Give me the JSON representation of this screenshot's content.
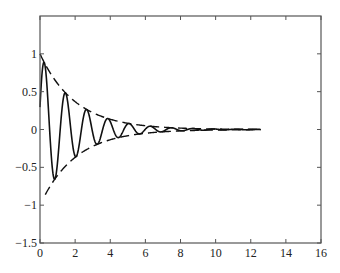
{
  "chart_data": {
    "type": "line",
    "title": "",
    "xlabel": "",
    "ylabel": "",
    "xlim": [
      0,
      16
    ],
    "ylim": [
      -1.5,
      1.5
    ],
    "grid": false,
    "legend": null,
    "x_ticks": [
      0,
      2,
      4,
      6,
      8,
      10,
      12,
      14,
      16
    ],
    "x_tick_labels": [
      "0",
      "2",
      "4",
      "6",
      "8",
      "10",
      "12",
      "14",
      "16"
    ],
    "y_ticks": [
      1,
      0.5,
      0,
      -0.5,
      -1,
      -1.5
    ],
    "y_tick_labels": [
      "1",
      "0.5",
      "0",
      "-0.5",
      "-1",
      "-1.5"
    ],
    "series": [
      {
        "name": "damped oscillation",
        "style": "solid",
        "description": "y = e^(-0.5t) * sin(5.2t + 0.3), t from 0 to 4*pi",
        "decay": 0.5,
        "omega": 5.2,
        "phase": 0.3,
        "t_start": 0,
        "t_end": 12.57,
        "sample_points": [
          {
            "x": 0,
            "y": 0.3
          },
          {
            "x": 0.25,
            "y": 0.87
          },
          {
            "x": 0.85,
            "y": -0.65
          },
          {
            "x": 1.45,
            "y": 0.44
          },
          {
            "x": 2.05,
            "y": -0.33
          },
          {
            "x": 2.65,
            "y": 0.25
          },
          {
            "x": 3.25,
            "y": -0.19
          },
          {
            "x": 3.85,
            "y": 0.14
          },
          {
            "x": 4.45,
            "y": -0.11
          },
          {
            "x": 5.05,
            "y": 0.08
          },
          {
            "x": 6.25,
            "y": 0.04
          },
          {
            "x": 8,
            "y": 0.01
          },
          {
            "x": 10,
            "y": 0.0
          },
          {
            "x": 12.57,
            "y": 0.0
          }
        ]
      },
      {
        "name": "upper envelope",
        "style": "dashed",
        "description": "y = e^(-0.5t)",
        "decay": 0.5,
        "sign": 1,
        "t_start": 0,
        "t_end": 12.57
      },
      {
        "name": "lower envelope",
        "style": "dashed",
        "description": "y = -e^(-0.5t)",
        "decay": 0.5,
        "sign": -1,
        "t_start": 0.3,
        "t_end": 12.57
      }
    ]
  },
  "plot_area": {
    "left_px": 40,
    "top_px": 16,
    "right_px": 321,
    "bottom_px": 243
  }
}
